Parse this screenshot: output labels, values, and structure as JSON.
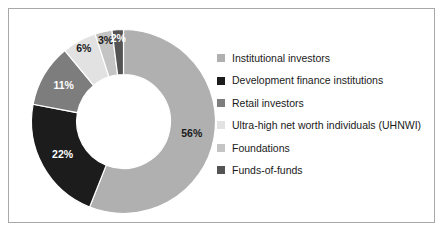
{
  "chart_data": {
    "type": "pie",
    "variant": "donut",
    "title": "",
    "subtitle": "",
    "xlabel": "",
    "ylabel": "",
    "units": "percent",
    "start_angle_deg": 0,
    "direction": "clockwise",
    "inner_radius_ratio": 0.51,
    "grid": false,
    "legend_position": "right",
    "categories": [
      "Institutional investors",
      "Development finance institutions",
      "Retail investors",
      "Ultra-high net worth individuals (UHNWI)",
      "Foundations",
      "Funds-of-funds"
    ],
    "values": [
      56,
      22,
      11,
      6,
      3,
      2
    ],
    "data_labels": [
      "56%",
      "22%",
      "11%",
      "6%",
      "3%",
      "2%"
    ],
    "colors": [
      "#b0b0b0",
      "#1c1c1c",
      "#7d7d7d",
      "#e2e2e2",
      "#c4c4c4",
      "#545454"
    ],
    "label_text_colors": [
      "#1a1a1a",
      "#ffffff",
      "#ffffff",
      "#1a1a1a",
      "#1a1a1a",
      "#ffffff"
    ],
    "slices": [
      {
        "label": "Institutional investors",
        "value": 56,
        "display": "56%",
        "color": "#b0b0b0"
      },
      {
        "label": "Development finance institutions",
        "value": 22,
        "display": "22%",
        "color": "#1c1c1c"
      },
      {
        "label": "Retail investors",
        "value": 11,
        "display": "11%",
        "color": "#7d7d7d"
      },
      {
        "label": "Ultra-high net worth individuals (UHNWI)",
        "value": 6,
        "display": "6%",
        "color": "#e2e2e2"
      },
      {
        "label": "Foundations",
        "value": 3,
        "display": "3%",
        "color": "#c4c4c4"
      },
      {
        "label": "Funds-of-funds",
        "value": 2,
        "display": "2%",
        "color": "#545454"
      }
    ]
  },
  "figure": {
    "border_color": "#a8a8a8",
    "background": "#ffffff"
  },
  "legend": {
    "items": [
      {
        "label": "Institutional investors",
        "color": "#b0b0b0"
      },
      {
        "label": "Development finance institutions",
        "color": "#1c1c1c"
      },
      {
        "label": "Retail investors",
        "color": "#7d7d7d"
      },
      {
        "label": "Ultra-high net worth individuals (UHNWI)",
        "color": "#e2e2e2"
      },
      {
        "label": "Foundations",
        "color": "#c4c4c4"
      },
      {
        "label": "Funds-of-funds",
        "color": "#545454"
      }
    ]
  }
}
